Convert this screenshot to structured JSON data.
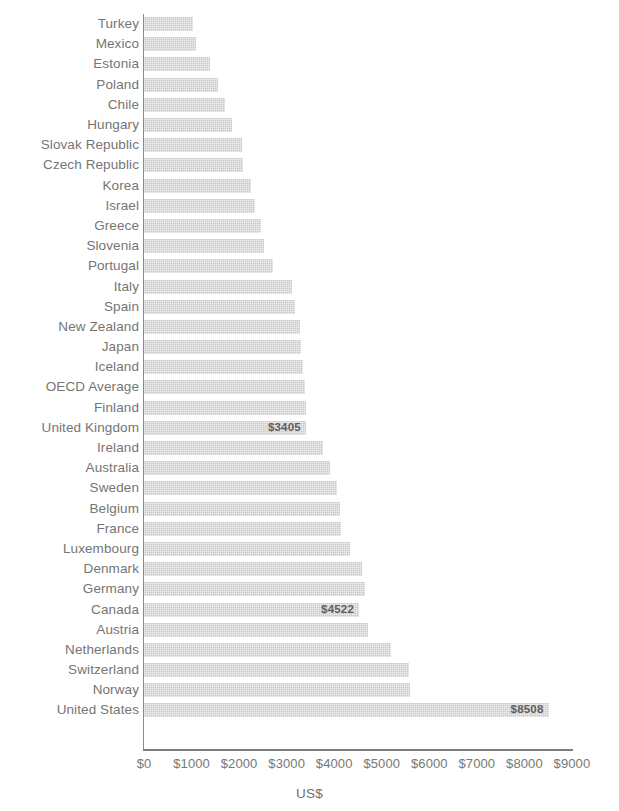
{
  "chart_data": {
    "type": "bar",
    "orientation": "horizontal",
    "title": "",
    "xlabel": "US$",
    "ylabel": "",
    "xlim": [
      0,
      9000
    ],
    "grid": false,
    "legend": null,
    "currency_prefix": "$",
    "x_tick_labels": [
      "$0",
      "$1000",
      "$2000",
      "$3000",
      "$4000",
      "$5000",
      "$6000",
      "$7000",
      "$8000",
      "$9000"
    ],
    "x_tick_values": [
      0,
      1000,
      2000,
      3000,
      4000,
      5000,
      6000,
      7000,
      8000,
      9000
    ],
    "categories": [
      "Turkey",
      "Mexico",
      "Estonia",
      "Poland",
      "Chile",
      "Hungary",
      "Slovak Republic",
      "Czech Republic",
      "Korea",
      "Israel",
      "Greece",
      "Slovenia",
      "Portugal",
      "Italy",
      "Spain",
      "New Zealand",
      "Japan",
      "Iceland",
      "OECD Average",
      "Finland",
      "United Kingdom",
      "Ireland",
      "Australia",
      "Sweden",
      "Belgium",
      "France",
      "Luxembourg",
      "Denmark",
      "Germany",
      "Canada",
      "Austria",
      "Netherlands",
      "Switzerland",
      "Norway",
      "United States"
    ],
    "values": [
      1030,
      1095,
      1390,
      1560,
      1700,
      1850,
      2060,
      2085,
      2250,
      2340,
      2465,
      2530,
      2715,
      3105,
      3170,
      3280,
      3305,
      3345,
      3390,
      3410,
      3405,
      3765,
      3915,
      4065,
      4125,
      4145,
      4335,
      4590,
      4650,
      4522,
      4720,
      5200,
      5575,
      5600,
      8508
    ],
    "labeled_points": [
      {
        "category": "United Kingdom",
        "label": "$3405"
      },
      {
        "category": "Canada",
        "label": "$4522"
      },
      {
        "category": "United States",
        "label": "$8508"
      }
    ],
    "colors": {
      "bar_fill": "#c9c9c9",
      "text": "#757575",
      "axis": "#8a8a8a",
      "value_label": "#5f5f5f",
      "background": "#ffffff"
    }
  }
}
